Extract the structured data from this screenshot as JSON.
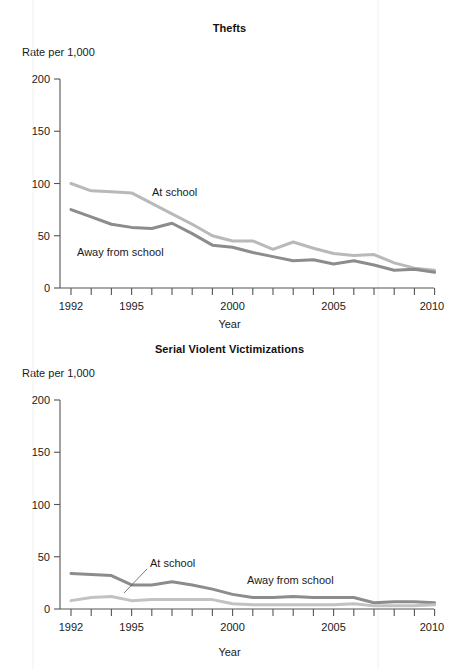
{
  "page": {
    "background_color": "#ffffff",
    "text_color": "#1a1a1a"
  },
  "charts": [
    {
      "id": "thefts",
      "title": "Thefts",
      "y_unit_label": "Rate per 1,000",
      "x_axis_title": "Year",
      "y_ticks": [
        "0",
        "50",
        "100",
        "150",
        "200"
      ],
      "x_ticks": [
        "1992",
        "1995",
        "2000",
        "2005",
        "2010"
      ],
      "series_labels": [
        "At school",
        "Away from school"
      ]
    },
    {
      "id": "serial",
      "title": "Serial Violent Victimizations",
      "y_unit_label": "Rate per 1,000",
      "x_axis_title": "Year",
      "y_ticks": [
        "0",
        "50",
        "100",
        "150",
        "200"
      ],
      "x_ticks": [
        "1992",
        "1995",
        "2000",
        "2005",
        "2010"
      ],
      "series_labels": [
        "At school",
        "Away from school"
      ]
    }
  ],
  "chart_data": [
    {
      "type": "line",
      "title": "Thefts",
      "xlabel": "Year",
      "ylabel": "Rate per 1,000",
      "ylim": [
        0,
        200
      ],
      "xlim": [
        1992,
        2010
      ],
      "yticks": [
        0,
        50,
        100,
        150,
        200
      ],
      "xticks": [
        1992,
        1995,
        2000,
        2005,
        2010
      ],
      "grid": false,
      "legend": "inline-annotations",
      "x": [
        1992,
        1993,
        1994,
        1995,
        1996,
        1997,
        1998,
        1999,
        2000,
        2001,
        2002,
        2003,
        2004,
        2005,
        2006,
        2007,
        2008,
        2009,
        2010
      ],
      "series": [
        {
          "name": "At school",
          "color": "#b9b9b9",
          "values": [
            100,
            93,
            92,
            91,
            81,
            71,
            61,
            50,
            45,
            45,
            37,
            44,
            38,
            33,
            31,
            32,
            24,
            19,
            17
          ]
        },
        {
          "name": "Away from school",
          "color": "#8c8c8c",
          "values": [
            75,
            68,
            61,
            58,
            57,
            62,
            52,
            41,
            39,
            34,
            30,
            26,
            27,
            23,
            26,
            22,
            17,
            18,
            15
          ]
        }
      ]
    },
    {
      "type": "line",
      "title": "Serial Violent Victimizations",
      "xlabel": "Year",
      "ylabel": "Rate per 1,000",
      "ylim": [
        0,
        200
      ],
      "xlim": [
        1992,
        2010
      ],
      "yticks": [
        0,
        50,
        100,
        150,
        200
      ],
      "xticks": [
        1992,
        1995,
        2000,
        2005,
        2010
      ],
      "grid": false,
      "legend": "inline-annotations",
      "x": [
        1992,
        1993,
        1994,
        1995,
        1996,
        1997,
        1998,
        1999,
        2000,
        2001,
        2002,
        2003,
        2004,
        2005,
        2006,
        2007,
        2008,
        2009,
        2010
      ],
      "series": [
        {
          "name": "At school",
          "color": "#c2c2c2",
          "values": [
            8,
            11,
            12,
            8,
            9,
            9,
            9,
            9,
            5,
            4,
            4,
            4,
            4,
            4,
            5,
            3,
            3,
            3,
            4
          ]
        },
        {
          "name": "Away from school",
          "color": "#8c8c8c",
          "values": [
            34,
            33,
            32,
            23,
            23,
            26,
            23,
            19,
            14,
            11,
            11,
            12,
            11,
            11,
            11,
            6,
            7,
            7,
            6
          ]
        }
      ]
    }
  ]
}
